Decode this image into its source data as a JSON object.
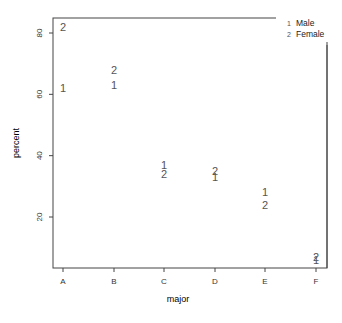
{
  "chart_data": {
    "type": "scatter",
    "title": "",
    "xlabel": "major",
    "ylabel": "percent",
    "categories": [
      "A",
      "B",
      "C",
      "D",
      "E",
      "F"
    ],
    "yticks": [
      20,
      40,
      60,
      80
    ],
    "ylim": [
      3,
      85
    ],
    "grid": false,
    "legend_position": "top-right",
    "series": [
      {
        "name": "Male",
        "symbol": "1",
        "values": [
          62,
          63,
          37,
          33,
          28,
          6
        ]
      },
      {
        "name": "Female",
        "symbol": "2",
        "values": [
          82,
          68,
          34,
          35,
          24,
          7
        ]
      }
    ]
  },
  "legend": {
    "items": [
      {
        "symbol": "1",
        "label": "Male"
      },
      {
        "symbol": "2",
        "label": "Female"
      }
    ]
  },
  "axes": {
    "x_label": "major",
    "y_label": "percent"
  }
}
